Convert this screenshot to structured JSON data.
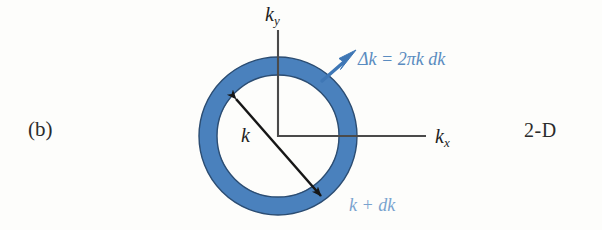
{
  "figure": {
    "panel_label": "(b)",
    "dimension_label": "2-D",
    "axes": {
      "y_symbol": "k",
      "y_subscript": "y",
      "x_symbol": "k",
      "x_subscript": "x"
    },
    "radius_label": "k",
    "annotations": {
      "ring_area": {
        "lhs": "Δk",
        "equals": " = ",
        "rhs": "2πk dk",
        "full": "Δk = 2πk dk",
        "color": "#5a8cc0"
      },
      "outer_radius": {
        "full": "k + dk",
        "color": "#7aa3cf"
      }
    },
    "colors": {
      "annulus_fill": "#4a81bd",
      "annulus_stroke": "#2e4f73",
      "axis_line": "#4a4a4a",
      "radius_arrow": "#161616",
      "callout_arrow": "#3f77b5",
      "background": "#fdfdfb",
      "text": "#2b2b2b"
    },
    "geometry": {
      "center_x": 278,
      "center_y": 136,
      "inner_radius": 61,
      "outer_radius": 79,
      "y_axis_top": 30,
      "y_axis_bottom": 136,
      "x_axis_left": 278,
      "x_axis_right": 426,
      "radius_arrow_start_x": 236,
      "radius_arrow_start_y": 99,
      "radius_arrow_end_x": 321,
      "radius_arrow_end_y": 196,
      "callout_arrow_tail_x": 323,
      "callout_arrow_tail_y": 80,
      "callout_arrow_head_x": 353,
      "callout_arrow_head_y": 54
    }
  }
}
